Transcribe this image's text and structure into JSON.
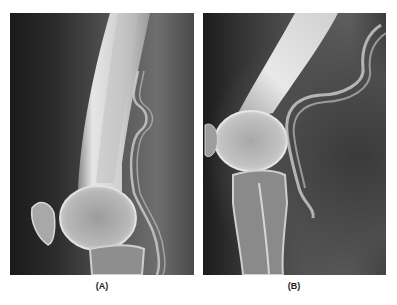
{
  "figure": {
    "panels": [
      {
        "id": "A",
        "label": "(A)",
        "content": "lateral knee radiograph, knee extended, femur shaft nearly vertical, patella and tibial plateau visible"
      },
      {
        "id": "B",
        "label": "(B)",
        "content": "lateral knee radiograph, knee flexed, femur angled diagonally, patella seated against femoral condyle, proximal tibia below"
      }
    ],
    "colors": {
      "background": "#ffffff",
      "film_dark": "#1a1a1a",
      "bone": "#d8d8d8",
      "soft_tissue": "#5e5e5e"
    }
  }
}
